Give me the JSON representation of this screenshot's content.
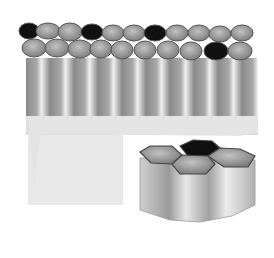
{
  "figure": {
    "panels": [
      {
        "name": "tissue-sheet",
        "description": "sheet of columnar cells viewed in perspective with hexagonal apical surfaces"
      },
      {
        "name": "cell-cluster",
        "description": "enlarged group of four hexagonal columnar cells"
      }
    ]
  },
  "colors": {
    "cell_top": "#8e8e8e",
    "cell_top_highlight": "#b5b5b5",
    "cell_dark": "#111111",
    "column_shadow": "#8a8a8a",
    "column_light": "#e6e6e6",
    "basal_layer": "#dcdcdc",
    "outline": "#555555"
  }
}
